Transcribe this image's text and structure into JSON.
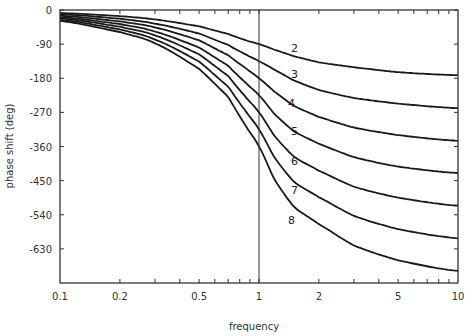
{
  "chart_data": {
    "type": "line",
    "title": "",
    "xlabel": "frequency",
    "ylabel": "phase shift (deg)",
    "xscale": "log",
    "xlim": [
      0.1,
      10
    ],
    "ylim": [
      -720,
      0
    ],
    "grid": false,
    "legend": "inline labels at right of each curve",
    "x_ticks": [
      0.1,
      0.2,
      0.5,
      1,
      2,
      5,
      10
    ],
    "x_tick_labels": [
      "0.1",
      "0.2",
      "0.5",
      "1",
      "2",
      "5",
      "10"
    ],
    "y_ticks": [
      0,
      -90,
      -180,
      -270,
      -360,
      -450,
      -540,
      -630
    ],
    "y_tick_labels": [
      "0",
      "-90",
      "-180",
      "-270",
      "-360",
      "-450",
      "-540",
      "-630"
    ],
    "annotations": [
      {
        "type": "vline",
        "x": 1
      }
    ],
    "x": [
      0.1,
      0.2,
      0.3,
      0.5,
      0.7,
      0.85,
      1,
      1.2,
      1.5,
      2,
      3,
      5,
      10
    ],
    "series": [
      {
        "name": "2",
        "label_at": [
          1.45,
          -110
        ],
        "values": [
          -8,
          -16,
          -25,
          -43,
          -63,
          -79,
          -90,
          -105,
          -122,
          -138,
          -151,
          -164,
          -172
        ]
      },
      {
        "name": "3",
        "label_at": [
          1.45,
          -180
        ],
        "values": [
          -11,
          -23,
          -36,
          -62,
          -92,
          -116,
          -135,
          -158,
          -186,
          -211,
          -232,
          -247,
          -259
        ]
      },
      {
        "name": "4",
        "label_at": [
          1.4,
          -255
        ],
        "values": [
          -15,
          -30,
          -46,
          -80,
          -119,
          -152,
          -180,
          -216,
          -253,
          -282,
          -310,
          -330,
          -345
        ]
      },
      {
        "name": "5",
        "label_at": [
          1.45,
          -330
        ],
        "values": [
          -19,
          -37,
          -57,
          -99,
          -147,
          -190,
          -225,
          -275,
          -320,
          -353,
          -388,
          -413,
          -430
        ]
      },
      {
        "name": "6",
        "label_at": [
          1.45,
          -410
        ],
        "values": [
          -22,
          -44,
          -67,
          -117,
          -174,
          -227,
          -270,
          -333,
          -387,
          -424,
          -466,
          -495,
          -516
        ]
      },
      {
        "name": "7",
        "label_at": [
          1.45,
          -485
        ],
        "values": [
          -26,
          -51,
          -78,
          -136,
          -202,
          -264,
          -315,
          -390,
          -453,
          -494,
          -543,
          -578,
          -602
        ]
      },
      {
        "name": "8",
        "label_at": [
          1.4,
          -565
        ],
        "values": [
          -29,
          -58,
          -88,
          -155,
          -229,
          -302,
          -360,
          -448,
          -519,
          -565,
          -621,
          -660,
          -688
        ]
      }
    ]
  }
}
